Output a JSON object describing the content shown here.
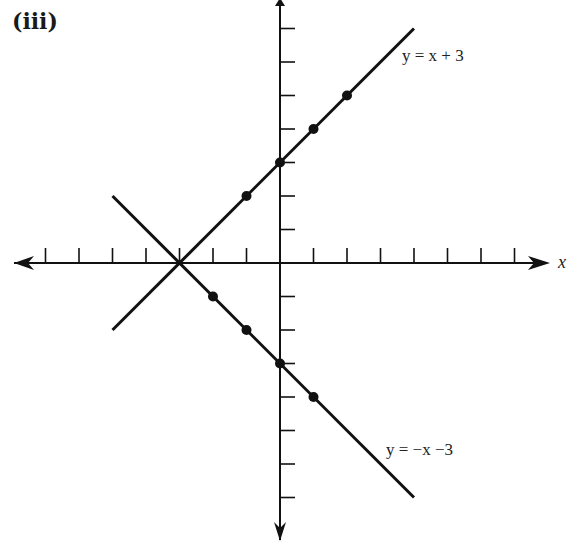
{
  "panel": {
    "label": "(iii)"
  },
  "axes": {
    "x_label": "x",
    "y_label": "y"
  },
  "lines": [
    {
      "name": "y = x + 3",
      "label": "y = x + 3"
    },
    {
      "name": "y = -x - 3",
      "label": "y = −x −3"
    }
  ],
  "chart_data": {
    "type": "line",
    "title": "(iii)",
    "xlabel": "x",
    "ylabel": "",
    "xlim": [
      -7.5,
      8
    ],
    "ylim": [
      -8,
      7.8
    ],
    "x_ticks": [
      -7,
      -6,
      -5,
      -4,
      -3,
      -2,
      -1,
      1,
      2,
      3,
      4,
      5,
      6,
      7
    ],
    "y_ticks": [
      -7,
      -6,
      -5,
      -4,
      -3,
      -2,
      -1,
      1,
      2,
      3,
      4,
      5,
      6,
      7
    ],
    "tick_labels_shown": false,
    "grid": false,
    "colors": {
      "ink": "#111111",
      "background": "#ffffff"
    },
    "series": [
      {
        "name": "y = x + 3",
        "line_endpoints": [
          [
            -5,
            -2
          ],
          [
            4,
            7
          ]
        ],
        "points": [
          [
            -1,
            2
          ],
          [
            0,
            3
          ],
          [
            1,
            4
          ],
          [
            2,
            5
          ]
        ]
      },
      {
        "name": "y = -x - 3",
        "line_endpoints": [
          [
            -5,
            2
          ],
          [
            4,
            -7
          ]
        ],
        "points": [
          [
            -2,
            -1
          ],
          [
            -1,
            -2
          ],
          [
            0,
            -3
          ],
          [
            1,
            -4
          ]
        ]
      }
    ],
    "annotations": [
      {
        "text": "y = x + 3",
        "near": [
          3.5,
          6.3
        ]
      },
      {
        "text": "y = −x −3",
        "near": [
          3.3,
          -5.6
        ]
      },
      {
        "text": "intersection",
        "at": [
          -3,
          0
        ]
      }
    ]
  }
}
